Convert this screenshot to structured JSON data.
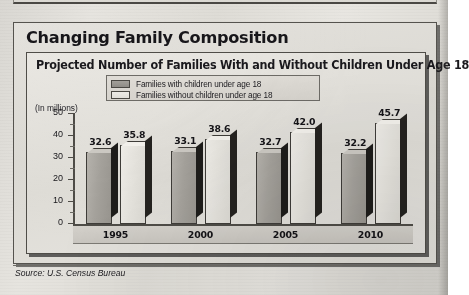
{
  "figure": {
    "title": "Changing Family Composition",
    "subtitle": "Projected Number of Families With and Without Children Under Age 18",
    "axis_unit": "(In millions)",
    "source": "Source: U.S. Census Bureau"
  },
  "colors": {
    "bar_with_children": "#a5a29c",
    "bar_without_children": "#e5e3dd",
    "bar_outline": "#3e3c38",
    "panel_background": "#dedcd6",
    "text": "#17161a"
  },
  "chart_data": {
    "type": "bar",
    "title": "Projected Number of Families With and Without Children Under Age 18",
    "subtitle": "Changing Family Composition",
    "xlabel": "",
    "ylabel": "(In millions)",
    "ylim": [
      0,
      50
    ],
    "yticks": [
      0,
      10,
      20,
      30,
      40,
      50
    ],
    "ytick_labels": [
      "0",
      "10",
      "20",
      "30",
      "40",
      "50"
    ],
    "minor_ticks": [
      5,
      15,
      25,
      35,
      45
    ],
    "grid": false,
    "legend_position": "top",
    "categories": [
      "1995",
      "2000",
      "2005",
      "2010"
    ],
    "series": [
      {
        "name": "Families with children under age 18",
        "values": [
          32.6,
          33.1,
          32.7,
          32.2
        ],
        "value_labels": [
          "32.6",
          "33.1",
          "32.7",
          "32.2"
        ],
        "color": "#a5a29c"
      },
      {
        "name": "Families without children under age 18",
        "values": [
          35.8,
          38.6,
          42.0,
          45.7
        ],
        "value_labels": [
          "35.8",
          "38.6",
          "42.0",
          "45.7"
        ],
        "color": "#e5e3dd"
      }
    ],
    "source": "Source: U.S. Census Bureau"
  }
}
